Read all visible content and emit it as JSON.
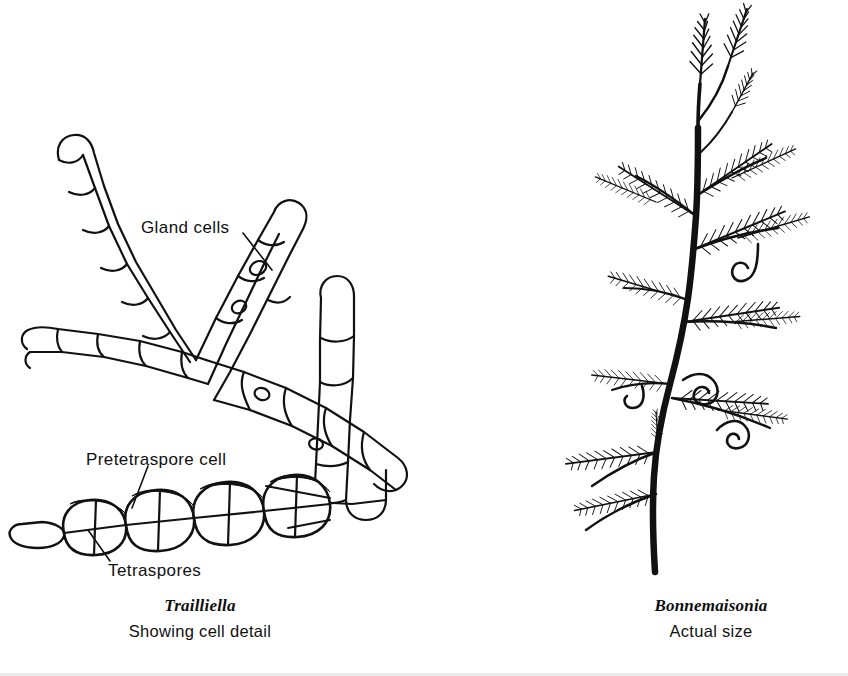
{
  "figure": {
    "background_color": "#ffffff",
    "ink_color": "#111111",
    "panels": [
      {
        "id": "trailliella",
        "side": "left",
        "caption_genus": "Trailliella",
        "caption_sub": "Showing cell detail",
        "subject": "filamentous red alga microscopic cell detail"
      },
      {
        "id": "bonnemaisonia",
        "side": "right",
        "caption_genus": "Bonnemaisonia",
        "caption_sub": "Actual size",
        "subject": "feathery branched alga whole thallus with coiled hooks"
      }
    ]
  },
  "annotations": {
    "gland_cells": {
      "label": "Gland cells",
      "leader_from": [
        243,
        233
      ],
      "leader_to": [
        272,
        270
      ]
    },
    "pretetraspore_cell": {
      "label": "Pretetraspore cell",
      "leader_from": [
        148,
        466
      ],
      "leader_to": [
        132,
        508
      ]
    },
    "tetraspores": {
      "label": "Tetraspores",
      "leader_from": [
        110,
        561
      ],
      "leader_to": [
        88,
        530
      ]
    }
  },
  "captions": {
    "left_genus": "Trailliella",
    "left_sub": "Showing cell detail",
    "right_genus": "Bonnemaisonia",
    "right_sub": "Actual size"
  }
}
